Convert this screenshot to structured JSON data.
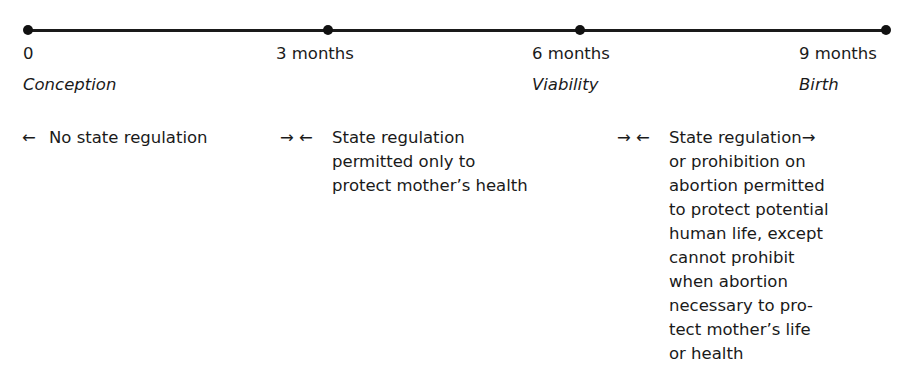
{
  "timeline": {
    "points": [
      {
        "value": "0",
        "label": "Conception"
      },
      {
        "value": "3 months",
        "label": ""
      },
      {
        "value": "6 months",
        "label": "Viability"
      },
      {
        "value": "9 months",
        "label": "Birth"
      }
    ]
  },
  "periods": [
    {
      "arrows": "←",
      "lines": [
        "No state regulation"
      ]
    },
    {
      "arrows": "→ ←",
      "lines": [
        "State regulation",
        "permitted only to",
        "protect mother’s health"
      ]
    },
    {
      "arrows": "→ ←",
      "lines": [
        "State regulation→",
        "or prohibition on",
        "abortion permitted",
        "to protect potential",
        "human life, except",
        "cannot prohibit",
        "when abortion",
        "necessary to pro-",
        "tect mother’s life",
        "or health"
      ]
    }
  ]
}
